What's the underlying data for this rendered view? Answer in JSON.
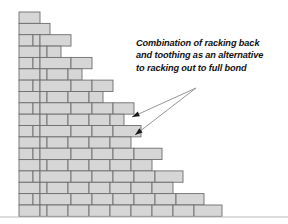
{
  "figure": {
    "background_color": "#ffffff",
    "width": 288,
    "height": 224
  },
  "annotation": {
    "text": "Combination of racking back\nand toothing as an alternative\nto racking out to full bond",
    "lines": [
      "Combination of racking back",
      "and toothing as an alternative",
      "to racking out to full bond"
    ],
    "style": "italic",
    "color": "#111111"
  },
  "leaders": [
    {
      "name": "upper-leader",
      "from_x": 196,
      "from_y": 88,
      "to_x": 132,
      "to_y": 117
    },
    {
      "name": "lower-leader",
      "from_x": 196,
      "from_y": 88,
      "to_x": 135,
      "to_y": 135
    }
  ],
  "wall": {
    "brick_fill": "#d6d6d6",
    "brick_stroke": "#6e6e6e",
    "left_edge": 19,
    "top_edge": 12,
    "bottom_edge": 212,
    "row_height": 11.35,
    "rows": [
      {
        "index": 0,
        "y": 12.0,
        "right_edge": 40,
        "bricks": [
          [
            19,
            40
          ]
        ]
      },
      {
        "index": 1,
        "y": 23.4,
        "right_edge": 50,
        "bricks": [
          [
            19,
            50
          ]
        ]
      },
      {
        "index": 2,
        "y": 34.7,
        "right_edge": 71,
        "bricks": [
          [
            19,
            33
          ],
          [
            33,
            40
          ],
          [
            40,
            71
          ]
        ]
      },
      {
        "index": 3,
        "y": 46.1,
        "right_edge": 61,
        "bricks": [
          [
            19,
            40
          ],
          [
            40,
            47
          ],
          [
            47,
            61
          ]
        ]
      },
      {
        "index": 4,
        "y": 57.4,
        "right_edge": 92,
        "bricks": [
          [
            19,
            33
          ],
          [
            33,
            40
          ],
          [
            40,
            71
          ],
          [
            71,
            92
          ]
        ]
      },
      {
        "index": 5,
        "y": 68.8,
        "right_edge": 82,
        "bricks": [
          [
            19,
            40
          ],
          [
            40,
            47
          ],
          [
            47,
            68
          ],
          [
            68,
            82
          ]
        ]
      },
      {
        "index": 6,
        "y": 80.1,
        "right_edge": 113,
        "bricks": [
          [
            19,
            33
          ],
          [
            33,
            40
          ],
          [
            40,
            71
          ],
          [
            71,
            92
          ],
          [
            92,
            113
          ]
        ]
      },
      {
        "index": 7,
        "y": 91.5,
        "right_edge": 103,
        "bricks": [
          [
            19,
            40
          ],
          [
            40,
            47
          ],
          [
            47,
            68
          ],
          [
            68,
            89
          ],
          [
            89,
            103
          ]
        ]
      },
      {
        "index": 8,
        "y": 102.8,
        "right_edge": 134,
        "bricks": [
          [
            19,
            33
          ],
          [
            33,
            40
          ],
          [
            40,
            71
          ],
          [
            71,
            92
          ],
          [
            92,
            113
          ],
          [
            113,
            134
          ]
        ]
      },
      {
        "index": 9,
        "y": 114.2,
        "right_edge": 124,
        "bricks": [
          [
            19,
            40
          ],
          [
            40,
            47
          ],
          [
            47,
            68
          ],
          [
            68,
            89
          ],
          [
            89,
            110
          ],
          [
            110,
            124
          ]
        ]
      },
      {
        "index": 10,
        "y": 125.5,
        "right_edge": 141,
        "bricks": [
          [
            19,
            33
          ],
          [
            33,
            40
          ],
          [
            40,
            71
          ],
          [
            71,
            92
          ],
          [
            92,
            113
          ],
          [
            113,
            141
          ]
        ]
      },
      {
        "index": 11,
        "y": 136.9,
        "right_edge": 131,
        "bricks": [
          [
            19,
            40
          ],
          [
            40,
            47
          ],
          [
            47,
            68
          ],
          [
            68,
            89
          ],
          [
            89,
            110
          ],
          [
            110,
            131
          ]
        ]
      },
      {
        "index": 12,
        "y": 148.2,
        "right_edge": 162,
        "bricks": [
          [
            19,
            33
          ],
          [
            33,
            40
          ],
          [
            40,
            71
          ],
          [
            71,
            92
          ],
          [
            92,
            113
          ],
          [
            113,
            134
          ],
          [
            134,
            162
          ]
        ]
      },
      {
        "index": 13,
        "y": 159.6,
        "right_edge": 152,
        "bricks": [
          [
            19,
            40
          ],
          [
            40,
            47
          ],
          [
            47,
            68
          ],
          [
            68,
            89
          ],
          [
            89,
            110
          ],
          [
            110,
            131
          ],
          [
            131,
            152
          ]
        ]
      },
      {
        "index": 14,
        "y": 170.9,
        "right_edge": 183,
        "bricks": [
          [
            19,
            33
          ],
          [
            33,
            40
          ],
          [
            40,
            71
          ],
          [
            71,
            92
          ],
          [
            92,
            113
          ],
          [
            113,
            134
          ],
          [
            134,
            155
          ],
          [
            155,
            183
          ]
        ]
      },
      {
        "index": 15,
        "y": 182.3,
        "right_edge": 173,
        "bricks": [
          [
            19,
            40
          ],
          [
            40,
            47
          ],
          [
            47,
            68
          ],
          [
            68,
            89
          ],
          [
            89,
            110
          ],
          [
            110,
            131
          ],
          [
            131,
            152
          ],
          [
            152,
            173
          ]
        ]
      },
      {
        "index": 16,
        "y": 193.6,
        "right_edge": 204,
        "bricks": [
          [
            19,
            33
          ],
          [
            33,
            40
          ],
          [
            40,
            71
          ],
          [
            71,
            92
          ],
          [
            92,
            113
          ],
          [
            113,
            134
          ],
          [
            134,
            155
          ],
          [
            155,
            176
          ],
          [
            176,
            204
          ]
        ]
      },
      {
        "index": 17,
        "y": 205.0,
        "right_edge": 222,
        "bricks": [
          [
            19,
            40
          ],
          [
            40,
            47
          ],
          [
            47,
            68
          ],
          [
            68,
            89
          ],
          [
            89,
            110
          ],
          [
            110,
            131
          ],
          [
            131,
            152
          ],
          [
            152,
            173
          ],
          [
            173,
            194
          ],
          [
            194,
            222
          ]
        ]
      }
    ]
  },
  "rule": {
    "name": "bottom-rule",
    "x1": 0,
    "x2": 288,
    "y": 217,
    "color": "#b8b8b8"
  }
}
